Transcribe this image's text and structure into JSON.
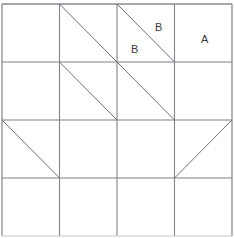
{
  "figure": {
    "type": "diagram",
    "background_color": "#ffffff",
    "grid": {
      "rows": 4,
      "cols": 4,
      "origin_x": 2,
      "origin_y": 4,
      "cell_width": 57.5,
      "cell_height": 58.0,
      "line_color": "#82828a",
      "line_width": 1.1,
      "outer_line_color": "#8a8a92",
      "outer_line_width": 1.3,
      "x_positions": [
        2,
        59.5,
        117,
        174.5,
        232
      ],
      "y_positions": [
        4,
        62,
        120,
        178,
        236
      ]
    },
    "diagonals": {
      "line_color": "#6f6f78",
      "line_width": 1.0,
      "items": [
        {
          "name": "diagonal-c2r1",
          "col": 2,
          "row": 1,
          "direction": "main"
        },
        {
          "name": "diagonal-c3r1",
          "col": 3,
          "row": 1,
          "direction": "main"
        },
        {
          "name": "diagonal-c2r2",
          "col": 2,
          "row": 2,
          "direction": "main"
        },
        {
          "name": "diagonal-c3r2",
          "col": 3,
          "row": 2,
          "direction": "main"
        },
        {
          "name": "diagonal-c1r3",
          "col": 1,
          "row": 3,
          "direction": "main"
        },
        {
          "name": "diagonal-c4r3",
          "col": 4,
          "row": 3,
          "direction": "anti"
        }
      ]
    },
    "labels": [
      {
        "name": "label-b-upper",
        "text": "B",
        "x": 155,
        "y": 22,
        "col": 3,
        "row": 1,
        "region": "upper-right-triangle"
      },
      {
        "name": "label-b-lower",
        "text": "B",
        "x": 131,
        "y": 44,
        "col": 3,
        "row": 1,
        "region": "lower-left-triangle"
      },
      {
        "name": "label-a",
        "text": "A",
        "x": 201,
        "y": 34,
        "col": 4,
        "row": 1,
        "region": "full-cell"
      }
    ]
  }
}
